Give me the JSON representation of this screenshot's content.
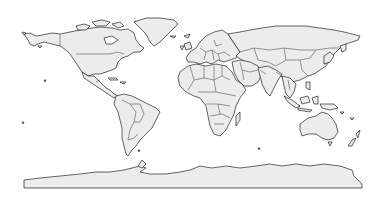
{
  "map": {
    "type": "world-political-outline",
    "projection": "equirectangular",
    "colors": {
      "land_fill": "#ececec",
      "outline": "#222222",
      "background": "#ffffff"
    },
    "regions": [
      "north-america",
      "greenland",
      "central-america-caribbean",
      "south-america",
      "europe",
      "africa",
      "madagascar",
      "russia-asia",
      "middle-east",
      "india",
      "southeast-asia",
      "indonesia-islands",
      "japan",
      "australia",
      "new-zealand",
      "antarctica"
    ]
  }
}
